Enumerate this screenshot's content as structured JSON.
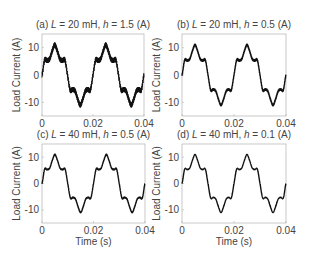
{
  "figure": {
    "y_axis_label": "Load Current (A)",
    "x_axis_label": "Time (s)"
  },
  "chart_data": [
    {
      "type": "line",
      "panel": "a",
      "title_prefix": "(a)",
      "title_L": "L",
      "title_L_value": " = 20 mH,",
      "title_h": "h",
      "title_h_value": " = 1.5 (A)",
      "xlabel": "",
      "ylabel": "Load Current (A)",
      "xlim": [
        0,
        0.04
      ],
      "ylim": [
        -15,
        15
      ],
      "xticks": [
        "0",
        "0.02",
        "0.04"
      ],
      "yticks": [
        "10",
        "0",
        "-10"
      ],
      "grid": false,
      "ripple_amplitude": 1.5,
      "x": [
        0,
        0.001,
        0.002,
        0.003,
        0.004,
        0.005,
        0.006,
        0.007,
        0.008,
        0.009,
        0.01,
        0.011,
        0.012,
        0.013,
        0.014,
        0.015,
        0.016,
        0.017,
        0.018,
        0.019,
        0.02,
        0.021,
        0.022,
        0.023,
        0.024,
        0.025,
        0.026,
        0.027,
        0.028,
        0.029,
        0.03,
        0.031,
        0.032,
        0.033,
        0.034,
        0.035,
        0.036,
        0.037,
        0.038,
        0.039,
        0.04
      ],
      "y": [
        0,
        5.4,
        5.3,
        5.9,
        8.8,
        11,
        8.8,
        5.9,
        5.3,
        5.4,
        0,
        -5.4,
        -5.3,
        -5.9,
        -8.8,
        -11,
        -8.8,
        -5.9,
        -5.3,
        -5.4,
        0,
        5.4,
        5.3,
        5.9,
        8.8,
        11,
        8.8,
        5.9,
        5.3,
        5.4,
        0,
        -5.4,
        -5.3,
        -5.9,
        -8.8,
        -11,
        -8.8,
        -5.9,
        -5.3,
        -5.4,
        0
      ]
    },
    {
      "type": "line",
      "panel": "b",
      "title_prefix": "(b)",
      "title_L": "L",
      "title_L_value": " = 20 mH,",
      "title_h": "h",
      "title_h_value": " = 0.5 (A)",
      "xlabel": "",
      "ylabel": "Load Current (A)",
      "xlim": [
        0,
        0.04
      ],
      "ylim": [
        -15,
        15
      ],
      "xticks": [
        "0",
        "0.02",
        "0.04"
      ],
      "yticks": [
        "10",
        "0",
        "-10"
      ],
      "grid": false,
      "ripple_amplitude": 0.5,
      "x": [
        0,
        0.001,
        0.002,
        0.003,
        0.004,
        0.005,
        0.006,
        0.007,
        0.008,
        0.009,
        0.01,
        0.011,
        0.012,
        0.013,
        0.014,
        0.015,
        0.016,
        0.017,
        0.018,
        0.019,
        0.02,
        0.021,
        0.022,
        0.023,
        0.024,
        0.025,
        0.026,
        0.027,
        0.028,
        0.029,
        0.03,
        0.031,
        0.032,
        0.033,
        0.034,
        0.035,
        0.036,
        0.037,
        0.038,
        0.039,
        0.04
      ],
      "y": [
        0,
        5.4,
        5.3,
        5.9,
        8.8,
        11,
        8.8,
        5.9,
        5.3,
        5.4,
        0,
        -5.4,
        -5.3,
        -5.9,
        -8.8,
        -11,
        -8.8,
        -5.9,
        -5.3,
        -5.4,
        0,
        5.4,
        5.3,
        5.9,
        8.8,
        11,
        8.8,
        5.9,
        5.3,
        5.4,
        0,
        -5.4,
        -5.3,
        -5.9,
        -8.8,
        -11,
        -8.8,
        -5.9,
        -5.3,
        -5.4,
        0
      ]
    },
    {
      "type": "line",
      "panel": "c",
      "title_prefix": "(c)",
      "title_L": "L",
      "title_L_value": " = 40 mH,",
      "title_h": "h",
      "title_h_value": " = 0.5 (A)",
      "xlabel": "Time (s)",
      "ylabel": "Load Current (A)",
      "xlim": [
        0,
        0.04
      ],
      "ylim": [
        -15,
        15
      ],
      "xticks": [
        "0",
        "0.02",
        "0.04"
      ],
      "yticks": [
        "10",
        "0",
        "-10"
      ],
      "grid": false,
      "ripple_amplitude": 0.25,
      "x": [
        0,
        0.001,
        0.002,
        0.003,
        0.004,
        0.005,
        0.006,
        0.007,
        0.008,
        0.009,
        0.01,
        0.011,
        0.012,
        0.013,
        0.014,
        0.015,
        0.016,
        0.017,
        0.018,
        0.019,
        0.02,
        0.021,
        0.022,
        0.023,
        0.024,
        0.025,
        0.026,
        0.027,
        0.028,
        0.029,
        0.03,
        0.031,
        0.032,
        0.033,
        0.034,
        0.035,
        0.036,
        0.037,
        0.038,
        0.039,
        0.04
      ],
      "y": [
        0,
        5.4,
        5.3,
        5.9,
        8.8,
        11,
        8.8,
        5.9,
        5.3,
        5.4,
        0,
        -5.4,
        -5.3,
        -5.9,
        -8.8,
        -11,
        -8.8,
        -5.9,
        -5.3,
        -5.4,
        0,
        5.4,
        5.3,
        5.9,
        8.8,
        11,
        8.8,
        5.9,
        5.3,
        5.4,
        0,
        -5.4,
        -5.3,
        -5.9,
        -8.8,
        -11,
        -8.8,
        -5.9,
        -5.3,
        -5.4,
        0
      ]
    },
    {
      "type": "line",
      "panel": "d",
      "title_prefix": "(d)",
      "title_L": "L",
      "title_L_value": " = 40 mH,",
      "title_h": "h",
      "title_h_value": " = 0.1 (A)",
      "xlabel": "Time (s)",
      "ylabel": "Load Current (A)",
      "xlim": [
        0,
        0.04
      ],
      "ylim": [
        -15,
        15
      ],
      "xticks": [
        "0",
        "0.02",
        "0.04"
      ],
      "yticks": [
        "10",
        "0",
        "-10"
      ],
      "grid": false,
      "ripple_amplitude": 0.1,
      "x": [
        0,
        0.001,
        0.002,
        0.003,
        0.004,
        0.005,
        0.006,
        0.007,
        0.008,
        0.009,
        0.01,
        0.011,
        0.012,
        0.013,
        0.014,
        0.015,
        0.016,
        0.017,
        0.018,
        0.019,
        0.02,
        0.021,
        0.022,
        0.023,
        0.024,
        0.025,
        0.026,
        0.027,
        0.028,
        0.029,
        0.03,
        0.031,
        0.032,
        0.033,
        0.034,
        0.035,
        0.036,
        0.037,
        0.038,
        0.039,
        0.04
      ],
      "y": [
        0,
        5.4,
        5.3,
        5.9,
        8.8,
        11,
        8.8,
        5.9,
        5.3,
        5.4,
        0,
        -5.4,
        -5.3,
        -5.9,
        -8.8,
        -11,
        -8.8,
        -5.9,
        -5.3,
        -5.4,
        0,
        5.4,
        5.3,
        5.9,
        8.8,
        11,
        8.8,
        5.9,
        5.3,
        5.4,
        0,
        -5.4,
        -5.3,
        -5.9,
        -8.8,
        -11,
        -8.8,
        -5.9,
        -5.3,
        -5.4,
        0
      ]
    }
  ]
}
